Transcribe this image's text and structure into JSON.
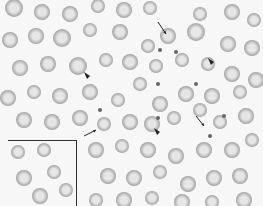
{
  "image": {
    "description": "Grayscale blood smear micrograph with red blood cells, platelets, arrows and arrowheads marking abnormal cells, and an inset box in the lower-left corner",
    "width": 263,
    "height": 206,
    "colors": {
      "background": "#f7f7f7",
      "cell_rim": "#9a9a9a",
      "cell_center": "#e6e6e6",
      "annotation": "#222222",
      "platelet": "#666666"
    },
    "cells": [
      [
        14,
        8,
        9
      ],
      [
        42,
        12,
        8
      ],
      [
        70,
        14,
        8
      ],
      [
        98,
        6,
        7
      ],
      [
        124,
        10,
        8
      ],
      [
        150,
        8,
        7
      ],
      [
        200,
        14,
        7
      ],
      [
        232,
        12,
        8
      ],
      [
        254,
        20,
        7
      ],
      [
        10,
        40,
        8
      ],
      [
        36,
        36,
        8
      ],
      [
        62,
        38,
        9
      ],
      [
        90,
        30,
        7
      ],
      [
        120,
        32,
        8
      ],
      [
        148,
        46,
        7
      ],
      [
        168,
        36,
        8
      ],
      [
        196,
        32,
        9
      ],
      [
        228,
        44,
        8
      ],
      [
        252,
        48,
        8
      ],
      [
        20,
        68,
        8
      ],
      [
        48,
        64,
        8
      ],
      [
        78,
        66,
        9
      ],
      [
        106,
        60,
        7
      ],
      [
        130,
        62,
        8
      ],
      [
        156,
        66,
        7
      ],
      [
        182,
        60,
        7
      ],
      [
        208,
        64,
        7
      ],
      [
        232,
        74,
        8
      ],
      [
        256,
        80,
        8
      ],
      [
        8,
        98,
        8
      ],
      [
        34,
        92,
        7
      ],
      [
        60,
        96,
        8
      ],
      [
        90,
        92,
        8
      ],
      [
        118,
        100,
        7
      ],
      [
        140,
        84,
        7
      ],
      [
        160,
        104,
        8
      ],
      [
        186,
        94,
        8
      ],
      [
        212,
        96,
        8
      ],
      [
        240,
        92,
        7
      ],
      [
        24,
        120,
        8
      ],
      [
        52,
        122,
        8
      ],
      [
        80,
        118,
        8
      ],
      [
        104,
        124,
        7
      ],
      [
        130,
        122,
        8
      ],
      [
        152,
        124,
        8
      ],
      [
        174,
        118,
        7
      ],
      [
        200,
        110,
        7
      ],
      [
        220,
        122,
        7
      ],
      [
        246,
        116,
        8
      ],
      [
        96,
        150,
        8
      ],
      [
        122,
        146,
        7
      ],
      [
        148,
        150,
        8
      ],
      [
        176,
        156,
        8
      ],
      [
        204,
        150,
        8
      ],
      [
        232,
        150,
        8
      ],
      [
        252,
        140,
        7
      ],
      [
        108,
        176,
        8
      ],
      [
        134,
        178,
        8
      ],
      [
        160,
        172,
        7
      ],
      [
        188,
        184,
        8
      ],
      [
        214,
        178,
        8
      ],
      [
        240,
        176,
        8
      ],
      [
        96,
        200,
        7
      ],
      [
        124,
        200,
        8
      ],
      [
        152,
        198,
        7
      ],
      [
        182,
        202,
        8
      ],
      [
        212,
        202,
        7
      ],
      [
        244,
        200,
        8
      ],
      [
        18,
        152,
        7
      ],
      [
        44,
        150,
        7
      ],
      [
        24,
        178,
        8
      ],
      [
        54,
        172,
        7
      ],
      [
        40,
        196,
        8
      ],
      [
        66,
        190,
        7
      ]
    ],
    "platelets": [
      [
        160,
        50
      ],
      [
        176,
        52
      ],
      [
        158,
        84
      ],
      [
        196,
        84
      ],
      [
        158,
        118
      ],
      [
        224,
        116
      ],
      [
        210,
        136
      ],
      [
        100,
        110
      ]
    ],
    "arrows": [
      {
        "type": "line-arrow",
        "from": [
          158,
          22
        ],
        "to": [
          166,
          34
        ]
      },
      {
        "type": "line-arrow",
        "from": [
          84,
          136
        ],
        "to": [
          96,
          130
        ]
      },
      {
        "type": "line-arrow",
        "from": [
          196,
          116
        ],
        "to": [
          204,
          126
        ]
      },
      {
        "type": "arrowhead",
        "at": [
          214,
          62
        ]
      },
      {
        "type": "arrowhead",
        "at": [
          90,
          76
        ]
      },
      {
        "type": "arrowhead",
        "at": [
          160,
          132
        ]
      }
    ],
    "inset_box": {
      "x": 8,
      "y": 140,
      "width": 68,
      "height": 66
    }
  }
}
